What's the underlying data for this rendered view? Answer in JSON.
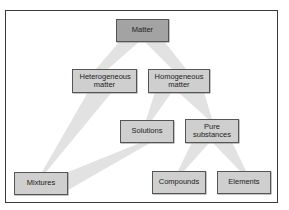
{
  "diagram": {
    "type": "tree",
    "colors": {
      "root_fill": "#a3a3a3",
      "node_fill": "#cfcfcf",
      "connector_fill": "#e2e2e2",
      "border": "#555555"
    },
    "nodes": {
      "matter": "Matter",
      "heterogeneous": "Heterogeneous matter",
      "homogeneous": "Homogeneous matter",
      "solutions": "Solutions",
      "pure_substances": "Pure substances",
      "mixtures": "Mixtures",
      "compounds": "Compounds",
      "elements": "Elements"
    },
    "edges": [
      [
        "Matter",
        "Heterogeneous matter"
      ],
      [
        "Matter",
        "Homogeneous matter"
      ],
      [
        "Heterogeneous matter",
        "Mixtures"
      ],
      [
        "Homogeneous matter",
        "Solutions"
      ],
      [
        "Homogeneous matter",
        "Pure substances"
      ],
      [
        "Solutions",
        "Mixtures"
      ],
      [
        "Pure substances",
        "Compounds"
      ],
      [
        "Pure substances",
        "Elements"
      ]
    ]
  }
}
